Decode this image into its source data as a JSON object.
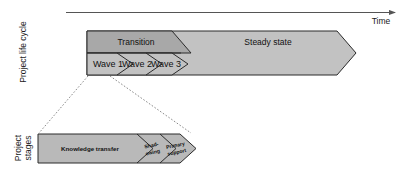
{
  "figure": {
    "axis": {
      "time_label": "Time"
    },
    "vertical_labels": {
      "lifecycle": "Project life cycle",
      "stages_line1": "Project",
      "stages_line2": "stages"
    },
    "lifecycle": {
      "phases": [
        {
          "id": "transition",
          "label": "Transition"
        },
        {
          "id": "steady-state",
          "label": "Steady state"
        }
      ],
      "waves": [
        {
          "id": "wave-1",
          "label": "Wave 1"
        },
        {
          "id": "wave-2",
          "label": "Wave 2"
        },
        {
          "id": "wave-3",
          "label": "Wave 3"
        }
      ]
    },
    "stages": [
      {
        "id": "knowledge-transfer",
        "label": "Knowledge transfer",
        "line1": "Knowledge transfer",
        "line2": ""
      },
      {
        "id": "shadowing",
        "label": "Shadowing",
        "line1": "Shad-",
        "line2": "owing"
      },
      {
        "id": "primary-support",
        "label": "Primary support",
        "line1": "Primary",
        "line2": "support"
      }
    ],
    "colors": {
      "transition_band": "#a8a8a8",
      "wave_band": "#c2c2c2",
      "steady_state": "#c2c2c2",
      "stage_bar": "#b9b9b9",
      "outline": "#2b2b2b",
      "axis": "#555555",
      "connector": "#8a8a8a",
      "text": "#111111"
    }
  }
}
